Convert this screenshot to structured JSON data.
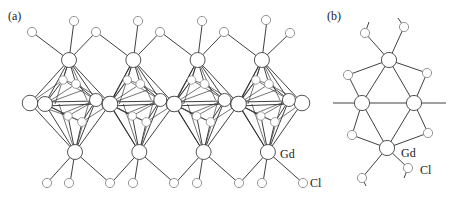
{
  "figure": {
    "panels": [
      {
        "id": "a",
        "label": "(a)",
        "atom_labels": {
          "gd": "Gd",
          "cl": "Cl"
        }
      },
      {
        "id": "b",
        "label": "(b)",
        "atom_labels": {
          "gd": "Gd",
          "cl": "Cl"
        }
      }
    ],
    "species": [
      "Gd",
      "Cl"
    ],
    "colors": {
      "bond": "#2a2a2a",
      "gd_outline": "#444444",
      "cl_outline": "#8a8a8a",
      "background": "#ffffff"
    }
  }
}
